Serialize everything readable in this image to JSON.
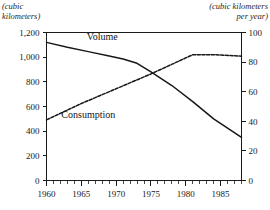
{
  "chart_data": {
    "type": "line",
    "title": "",
    "xlabel": "",
    "ylabel": "(cubic kilometers)",
    "y2label": "(cubic kilometers per year)",
    "left_axis_unit_line1": "(cubic",
    "left_axis_unit_line2": "kilometers)",
    "right_axis_unit_line1": "(cubic kilometers",
    "right_axis_unit_line2": "per year)",
    "xlim": [
      1960,
      1988
    ],
    "ylim": [
      0,
      1200
    ],
    "y2lim": [
      0,
      100
    ],
    "grid": false,
    "legend_position": "inline-annotations",
    "x_major_ticks": [
      1960,
      1965,
      1970,
      1975,
      1980,
      1985
    ],
    "x_major_tick_labels": [
      "1960",
      "1965",
      "1970",
      "1975",
      "1980",
      "1985"
    ],
    "x_minor_tick_step": 1,
    "y_left_ticks": [
      0,
      200,
      400,
      600,
      800,
      1000,
      1200
    ],
    "y_left_tick_labels": [
      "0",
      "200",
      "400",
      "600",
      "800",
      "1,000",
      "1,200"
    ],
    "y_right_ticks": [
      0,
      20,
      40,
      60,
      80,
      100
    ],
    "y_right_tick_labels": [
      "0",
      "20",
      "40",
      "60",
      "80",
      "100"
    ],
    "series": [
      {
        "name": "Volume",
        "axis": "left",
        "style": "solid",
        "annotation_label": "Volume",
        "x": [
          1960,
          1963,
          1966,
          1969,
          1971,
          1973,
          1975,
          1978,
          1981,
          1984,
          1988
        ],
        "values": [
          1120,
          1080,
          1045,
          1010,
          985,
          950,
          880,
          770,
          640,
          500,
          350
        ]
      },
      {
        "name": "Consumption",
        "axis": "right",
        "style": "dashed",
        "annotation_label": "Consumption",
        "x": [
          1960,
          1965,
          1970,
          1975,
          1981,
          1984,
          1988
        ],
        "values": [
          41,
          52,
          62,
          72,
          85,
          85,
          84
        ]
      }
    ],
    "annotations": [
      {
        "text": "Volume",
        "x": 1968,
        "y_left": 1140
      },
      {
        "text": "Consumption",
        "x": 1966,
        "y_right": 42
      }
    ]
  }
}
